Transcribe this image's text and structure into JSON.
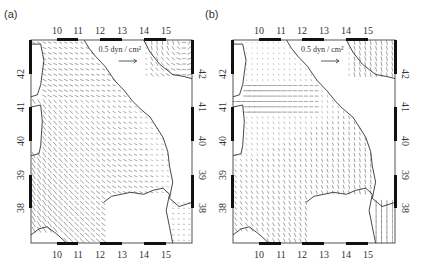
{
  "figure": {
    "panels": [
      {
        "id": "a",
        "label": "(a)",
        "legend": {
          "text": "0.5 dyn / cm²",
          "magnitude": 0.5,
          "unit": "dyn/cm²"
        },
        "frame": {
          "x0": 31,
          "x1": 192,
          "y0": 40,
          "y1": 243
        },
        "lon_ticks": [
          {
            "label": "10",
            "x": 57
          },
          {
            "label": "11",
            "x": 78
          },
          {
            "label": "12",
            "x": 100
          },
          {
            "label": "13",
            "x": 122
          },
          {
            "label": "14",
            "x": 144
          },
          {
            "label": "15",
            "x": 166
          }
        ],
        "lat_ticks": [
          {
            "label": "42",
            "y": 74
          },
          {
            "label": "41",
            "y": 107
          },
          {
            "label": "40",
            "y": 141
          },
          {
            "label": "39",
            "y": 175
          },
          {
            "label": "38",
            "y": 208
          }
        ],
        "field_pattern": "strong"
      },
      {
        "id": "b",
        "label": "(b)",
        "legend": {
          "text": "0.5 dyn / cm²",
          "magnitude": 0.5,
          "unit": "dyn/cm²"
        },
        "frame": {
          "x0": 233,
          "x1": 395,
          "y0": 40,
          "y1": 243
        },
        "lon_ticks": [
          {
            "label": "10",
            "x": 259
          },
          {
            "label": "11",
            "x": 281
          },
          {
            "label": "12",
            "x": 302
          },
          {
            "label": "13",
            "x": 324
          },
          {
            "label": "14",
            "x": 346
          },
          {
            "label": "15",
            "x": 368
          }
        ],
        "lat_ticks": [
          {
            "label": "42",
            "y": 74
          },
          {
            "label": "41",
            "y": 107
          },
          {
            "label": "40",
            "y": 141
          },
          {
            "label": "39",
            "y": 175
          },
          {
            "label": "38",
            "y": 208
          }
        ],
        "field_pattern": "weak"
      }
    ],
    "axes": {
      "x_label": "Longitude (°E)",
      "y_label": "Latitude (°N)",
      "lon_range": [
        8.8,
        16.3
      ],
      "lat_range": [
        37.0,
        43.0
      ]
    },
    "colors": {
      "frame": "#555555",
      "bar": "#111111",
      "vector": "#333333",
      "coast": "#333333"
    }
  }
}
